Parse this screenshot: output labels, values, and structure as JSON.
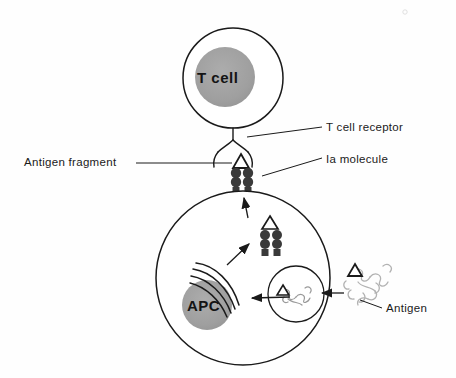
{
  "figure": {
    "background_color": "#fefefe",
    "line_color": "#1a1a1a",
    "nucleus_fill": "#999999",
    "ia_fill": "#3a3a3a",
    "antigen_stroke": "#b0b0b0"
  },
  "cells": {
    "t_cell": {
      "label": "T cell",
      "cx": 233,
      "cy": 78,
      "r": 50,
      "nucleus_cx": 225,
      "nucleus_cy": 77,
      "nucleus_r": 30
    },
    "apc_cell": {
      "label": "APC",
      "cx": 243,
      "cy": 278,
      "r": 87,
      "nucleus_cx": 207,
      "nucleus_cy": 305,
      "nucleus_r": 25
    }
  },
  "labels": {
    "t_cell_receptor": "T cell receptor",
    "ia_molecule": "Ia molecule",
    "antigen_fragment": "Antigen fragment",
    "antigen": "Antigen"
  },
  "structures": {
    "receptor": "t-cell-receptor-fork",
    "ia_surface": "ia-molecule-surface",
    "ia_internal": "ia-molecule-internal",
    "golgi": "golgi-arcs",
    "endosome": "endosome-vesicle",
    "external_antigen": "external-antigen-squiggle"
  },
  "arrows": [
    {
      "name": "antigen-uptake-arrow",
      "from": "external-antigen",
      "to": "endosome"
    },
    {
      "name": "endosome-to-golgi-arrow",
      "from": "endosome",
      "to": "golgi"
    },
    {
      "name": "golgi-to-ia-arrow",
      "from": "golgi",
      "to": "ia-internal"
    },
    {
      "name": "ia-to-surface-arrow",
      "from": "ia-internal",
      "to": "ia-surface"
    }
  ]
}
